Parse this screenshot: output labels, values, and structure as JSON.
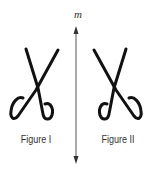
{
  "diagram": {
    "type": "reflection",
    "line_of_reflection": {
      "label": "m",
      "x": 76,
      "y_top": 28,
      "y_bottom": 162,
      "arrows": "both"
    },
    "figures": [
      {
        "id": "figure-1",
        "label": "Figure I",
        "shape": "scissors",
        "orientation": "original"
      },
      {
        "id": "figure-2",
        "label": "Figure II",
        "shape": "scissors",
        "orientation": "mirrored across m"
      }
    ],
    "colors": {
      "stroke": "#111111",
      "line": "#444444",
      "text": "#333333",
      "background": "#ffffff"
    }
  }
}
